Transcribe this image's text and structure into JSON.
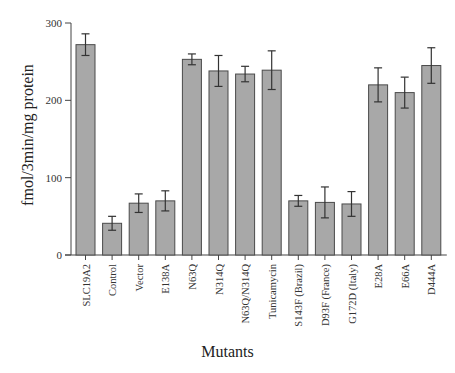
{
  "chart_data": {
    "type": "bar",
    "title": "",
    "xlabel": "Mutants",
    "ylabel": "fmol/3min/mg protein",
    "ylim": [
      0,
      300
    ],
    "yticks": [
      0,
      100,
      200,
      300
    ],
    "grid": false,
    "legend": null,
    "categories": [
      "SLC19A2",
      "Control",
      "Vector",
      "E138A",
      "N63Q",
      "N314Q",
      "N63Q/N314Q",
      "Tunicamycin",
      "S143F (Brazil)",
      "D93F (France)",
      "G172D (Italy)",
      "E28A",
      "E66A",
      "D444A"
    ],
    "values": [
      272,
      41,
      67,
      70,
      253,
      238,
      234,
      239,
      70,
      68,
      66,
      220,
      210,
      245
    ],
    "errors": [
      14,
      9,
      12,
      13,
      7,
      20,
      10,
      25,
      7,
      20,
      16,
      22,
      20,
      23
    ]
  },
  "style": {
    "bar_fill": "#a8a8a8",
    "bar_stroke": "#4a4a4a",
    "axis_color": "#444444",
    "error_color": "#333333"
  }
}
